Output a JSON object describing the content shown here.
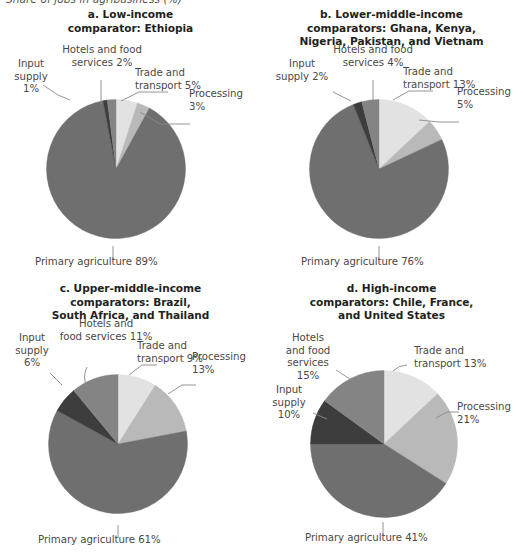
{
  "figure": {
    "caption": "Share of jobs in agribusiness (%)"
  },
  "palette": {
    "trade_and_transport": "#e2e2e2",
    "processing": "#b9b9b9",
    "primary_agriculture": "#6f6f6f",
    "input_supply": "#3d3d3d",
    "hotels_and_food_services": "#848484",
    "leader_line": "#8c8987",
    "title_text": "#231f20",
    "label_text": "#4b4846"
  },
  "panels": [
    {
      "id": "a",
      "title": "a. Low-income\ncomparator: Ethiopia",
      "title_lines": [
        "a. Low-income",
        "comparator: Ethiopia"
      ],
      "labels": {
        "input_supply": "Input\nsupply\n1%",
        "hotels": "Hotels and food\nservices 2%",
        "trade": "Trade and\ntransport 5%",
        "processing": "Processing\n3%",
        "primary": "Primary agriculture 89%"
      }
    },
    {
      "id": "b",
      "title": "b. Lower-middle-income\ncomparators: Ghana, Kenya,\nNigeria, Pakistan, and Vietnam",
      "title_lines": [
        "b. Lower-middle-income",
        "comparators: Ghana, Kenya,",
        "Nigeria, Pakistan, and Vietnam"
      ],
      "labels": {
        "input_supply": "Input\nsupply 2%",
        "hotels": "Hotels and food\nservices 4%",
        "trade": "Trade and\ntransport 13%",
        "processing": "Processing\n5%",
        "primary": "Primary agriculture 76%"
      }
    },
    {
      "id": "c",
      "title": "c. Upper-middle-income\ncomparators: Brazil,\nSouth Africa, and Thailand",
      "title_lines": [
        "c. Upper-middle-income",
        "comparators: Brazil,",
        "South Africa, and Thailand"
      ],
      "labels": {
        "input_supply": "Input\nsupply\n6%",
        "hotels": "Hotels and\nfood services 11%",
        "trade": "Trade and\ntransport 9%",
        "processing": "Processing\n13%",
        "primary": "Primary agriculture 61%"
      }
    },
    {
      "id": "d",
      "title": "d. High-income\ncomparators: Chile, France,\nand United States",
      "title_lines": [
        "d. High-income",
        "comparators: Chile, France,",
        "and United States"
      ],
      "labels": {
        "input_supply": "Input\nsupply\n10%",
        "hotels": "Hotels\nand food\nservices\n15%",
        "trade": "Trade and\ntransport 13%",
        "processing": "Processing\n21%",
        "primary": "Primary agriculture 41%"
      }
    }
  ],
  "chart_data": [
    {
      "type": "pie",
      "title": "a. Low-income comparator: Ethiopia",
      "categories": [
        "Trade and transport",
        "Processing",
        "Primary agriculture",
        "Input supply",
        "Hotels and food services"
      ],
      "values": [
        5,
        3,
        89,
        1,
        2
      ],
      "unit": "%",
      "colors": [
        "#e2e2e2",
        "#b9b9b9",
        "#6f6f6f",
        "#3d3d3d",
        "#848484"
      ],
      "start_angle_deg": 0,
      "direction": "clockwise",
      "legend": "none",
      "labels_inline": true
    },
    {
      "type": "pie",
      "title": "b. Lower-middle-income comparators: Ghana, Kenya, Nigeria, Pakistan, and Vietnam",
      "categories": [
        "Trade and transport",
        "Processing",
        "Primary agriculture",
        "Input supply",
        "Hotels and food services"
      ],
      "values": [
        13,
        5,
        76,
        2,
        4
      ],
      "unit": "%",
      "colors": [
        "#e2e2e2",
        "#b9b9b9",
        "#6f6f6f",
        "#3d3d3d",
        "#848484"
      ],
      "start_angle_deg": 0,
      "direction": "clockwise",
      "legend": "none",
      "labels_inline": true
    },
    {
      "type": "pie",
      "title": "c. Upper-middle-income comparators: Brazil, South Africa, and Thailand",
      "categories": [
        "Trade and transport",
        "Processing",
        "Primary agriculture",
        "Input supply",
        "Hotels and food services"
      ],
      "values": [
        9,
        13,
        61,
        6,
        11
      ],
      "unit": "%",
      "colors": [
        "#e2e2e2",
        "#b9b9b9",
        "#6f6f6f",
        "#3d3d3d",
        "#848484"
      ],
      "start_angle_deg": 0,
      "direction": "clockwise",
      "legend": "none",
      "labels_inline": true
    },
    {
      "type": "pie",
      "title": "d. High-income comparators: Chile, France, and United States",
      "categories": [
        "Trade and transport",
        "Processing",
        "Primary agriculture",
        "Input supply",
        "Hotels and food services"
      ],
      "values": [
        13,
        21,
        41,
        10,
        15
      ],
      "unit": "%",
      "colors": [
        "#e2e2e2",
        "#b9b9b9",
        "#6f6f6f",
        "#3d3d3d",
        "#848484"
      ],
      "start_angle_deg": 0,
      "direction": "clockwise",
      "legend": "none",
      "labels_inline": true
    }
  ]
}
